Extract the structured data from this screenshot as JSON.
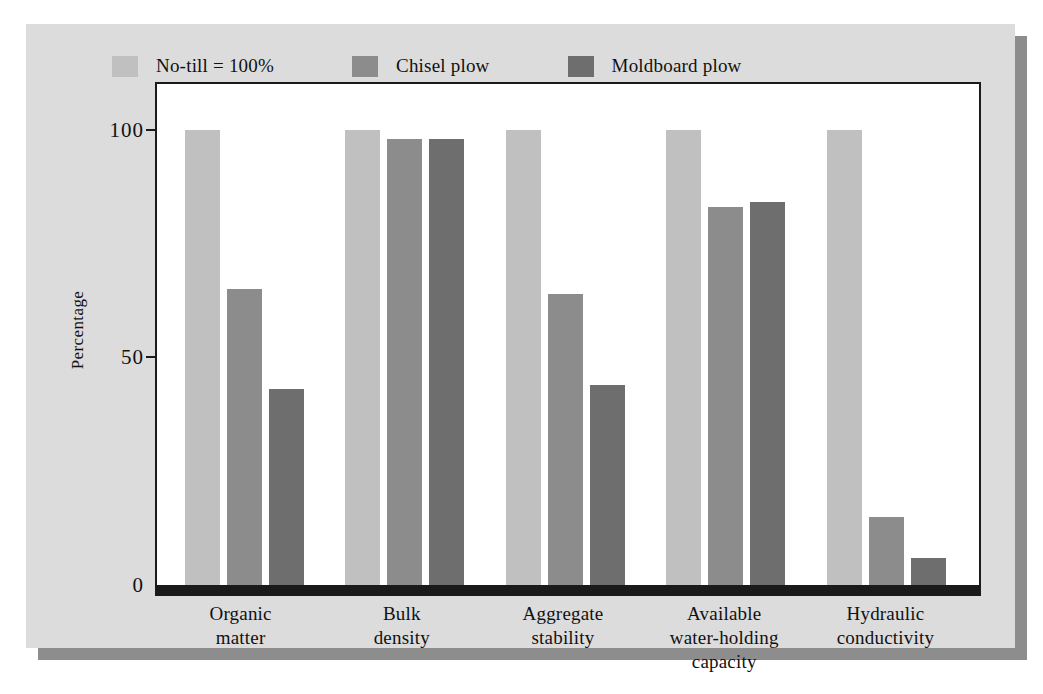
{
  "chart_data": {
    "type": "bar",
    "title": "",
    "subtitle": "",
    "xlabel": "",
    "ylabel": "Percentage",
    "ylim": [
      0,
      110
    ],
    "yticks": [
      0,
      50,
      100
    ],
    "ytick_labels": [
      "0",
      "50",
      "100"
    ],
    "grid": false,
    "legend_position": "top-left",
    "categories": [
      "Organic\nmatter",
      "Bulk\ndensity",
      "Aggregate\nstability",
      "Available\nwater-holding\ncapacity",
      "Hydraulic\nconductivity"
    ],
    "series": [
      {
        "name": "No-till = 100%",
        "color": "#c0c0c0",
        "values": [
          100,
          100,
          100,
          100,
          100
        ]
      },
      {
        "name": "Chisel plow",
        "color": "#8c8c8c",
        "values": [
          65,
          98,
          64,
          83,
          15
        ]
      },
      {
        "name": "Moldboard plow",
        "color": "#6e6e6e",
        "values": [
          43,
          98,
          44,
          84,
          6
        ]
      }
    ]
  },
  "legend": {
    "items": [
      {
        "label": "No-till = 100%",
        "color": "#c0c0c0"
      },
      {
        "label": "Chisel plow",
        "color": "#8c8c8c"
      },
      {
        "label": "Moldboard plow",
        "color": "#6e6e6e"
      }
    ]
  },
  "axes": {
    "y_title": "Percentage",
    "y_ticks": [
      "100",
      "50",
      "0"
    ],
    "x_categories": [
      {
        "lines": [
          "Organic",
          "matter"
        ]
      },
      {
        "lines": [
          "Bulk",
          "density"
        ]
      },
      {
        "lines": [
          "Aggregate",
          "stability"
        ]
      },
      {
        "lines": [
          "Available",
          "water-holding",
          "capacity"
        ]
      },
      {
        "lines": [
          "Hydraulic",
          "conductivity"
        ]
      }
    ]
  },
  "colors": {
    "page_background": "#ffffff",
    "panel_background": "#dcdcdc",
    "panel_shadow": "#8d8d8d",
    "plot_background": "#ffffff",
    "axis": "#1a1a1a",
    "text": "#111111"
  }
}
